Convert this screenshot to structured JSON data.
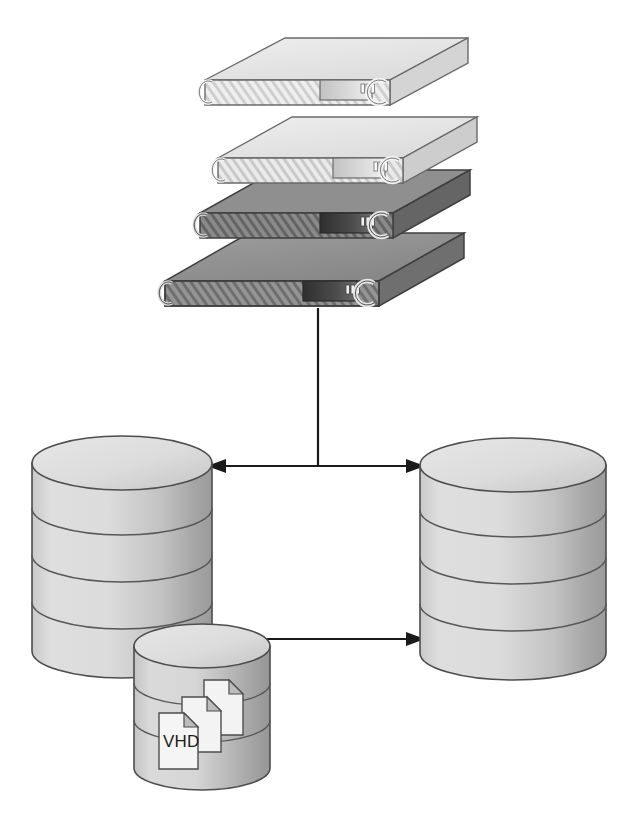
{
  "diagram": {
    "background_color": "#ffffff",
    "line_color": "#1a1a1a",
    "labels": {
      "vhd": "VHD"
    },
    "server_stack": {
      "name": "rack-server-stack",
      "count": 4,
      "servers": [
        {
          "index": 1,
          "position": "top",
          "shade": "light",
          "top_color": "#e4e4e4",
          "front_color": "#efefef",
          "side_color": "#d2d2d2",
          "display_color": "#d8d8d8",
          "led_count": 3,
          "has_handle": true,
          "has_vent_hatch": true
        },
        {
          "index": 2,
          "position": "upper-middle",
          "shade": "light",
          "top_color": "#e0e0e0",
          "front_color": "#ebebeb",
          "side_color": "#cccccc",
          "display_color": "#d0d0d0",
          "led_count": 3,
          "has_handle": true,
          "has_vent_hatch": true
        },
        {
          "index": 3,
          "position": "lower-middle",
          "shade": "dark",
          "top_color": "#8e8e8e",
          "front_color": "#7e7e7e",
          "side_color": "#6e6e6e",
          "display_color": "#3c3c3c",
          "led_count": 3,
          "has_handle": true,
          "has_vent_hatch": true
        },
        {
          "index": 4,
          "position": "bottom",
          "shade": "dark",
          "top_color": "#9a9a9a",
          "front_color": "#8a8a8a",
          "side_color": "#787878",
          "display_color": "#3c3c3c",
          "led_count": 3,
          "has_handle": true,
          "has_vent_hatch": true
        }
      ]
    },
    "storage_nodes": [
      {
        "name": "left-storage-cylinder",
        "role": "primary-storage",
        "disc_segments": 4,
        "fill_color": "#d2d2d2",
        "top_color": "#dcdcdc",
        "shadow_color": "#a8a8a8"
      },
      {
        "name": "right-storage-cylinder",
        "role": "replica-storage",
        "disc_segments": 4,
        "fill_color": "#d2d2d2",
        "top_color": "#dcdcdc",
        "shadow_color": "#a8a8a8"
      },
      {
        "name": "vhd-storage-cylinder",
        "role": "vhd-volume",
        "disc_segments": 3,
        "fill_color": "#cfcfcf",
        "top_color": "#dedede",
        "shadow_color": "#a0a0a0",
        "document_icons": 3,
        "document_label": "VHD"
      }
    ],
    "connectors": [
      {
        "name": "server-to-bus-connector",
        "type": "line",
        "orientation": "vertical",
        "from": "rack-server-stack",
        "to": "storage-bus",
        "arrowheads": 0
      },
      {
        "name": "storage-bus-connector",
        "type": "arrow",
        "orientation": "horizontal",
        "from": "left-storage-cylinder",
        "to": "right-storage-cylinder",
        "arrowheads": 2,
        "direction": "bidirectional"
      },
      {
        "name": "vhd-to-replica-connector",
        "type": "arrow",
        "orientation": "horizontal",
        "from": "vhd-storage-cylinder",
        "to": "right-storage-cylinder",
        "arrowheads": 1,
        "direction": "unidirectional"
      }
    ]
  }
}
